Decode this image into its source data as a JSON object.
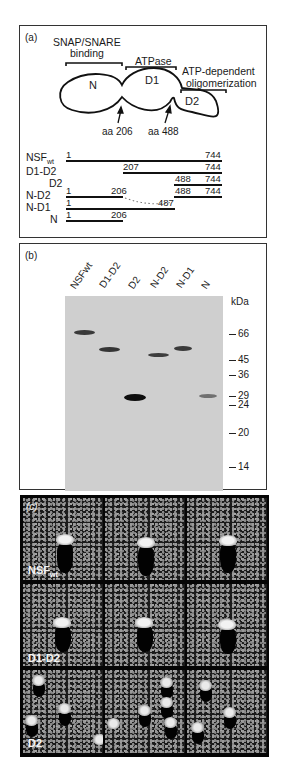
{
  "panel_a": {
    "label": "(a)",
    "domain_annotations": {
      "snap_snare": [
        "SNAP/SNARE",
        "binding"
      ],
      "atpase": "ATPase",
      "oligomerization": [
        "ATP-dependent",
        "oligomerization"
      ]
    },
    "domains": [
      "N",
      "D1",
      "D2"
    ],
    "arrows": [
      "aa 206",
      "aa 488"
    ],
    "constructs": [
      {
        "name": "NSF",
        "sub": "wt",
        "segments": [
          {
            "start": 1,
            "end": 744
          }
        ],
        "labels": [
          "1",
          "744"
        ]
      },
      {
        "name": "D1-D2",
        "sub": "",
        "segments": [
          {
            "start": 207,
            "end": 744
          }
        ],
        "labels": [
          "207",
          "744"
        ]
      },
      {
        "name": "D2",
        "sub": "",
        "segments": [
          {
            "start": 488,
            "end": 744
          }
        ],
        "labels": [
          "488",
          "744"
        ]
      },
      {
        "name": "N-D2",
        "sub": "",
        "segments": [
          {
            "start": 1,
            "end": 206
          },
          {
            "start": 488,
            "end": 744
          }
        ],
        "labels": [
          "1",
          "206",
          "488",
          "744"
        ]
      },
      {
        "name": "N-D1",
        "sub": "",
        "segments": [
          {
            "start": 1,
            "end": 487
          }
        ],
        "labels": [
          "1",
          "487"
        ]
      },
      {
        "name": "N",
        "sub": "",
        "segments": [
          {
            "start": 1,
            "end": 206
          }
        ],
        "labels": [
          "1",
          "206"
        ]
      }
    ]
  },
  "panel_b": {
    "label": "(b)",
    "lanes": [
      "NSFwt",
      "D1-D2",
      "D2",
      "N-D2",
      "N-D1",
      "N"
    ],
    "unit": "kDa",
    "markers": [
      "66",
      "45",
      "36",
      "29",
      "24",
      "20",
      "14"
    ]
  },
  "panel_c": {
    "label": "(c)",
    "rows": [
      {
        "name": "NSF",
        "sub": "wt"
      },
      {
        "name": "D1-D2",
        "sub": ""
      },
      {
        "name": "D2",
        "sub": ""
      }
    ]
  },
  "colors": {
    "gel_background": "#cfcfcf",
    "band_dark": "#2a2a2a",
    "micrograph_background": "#050505"
  }
}
